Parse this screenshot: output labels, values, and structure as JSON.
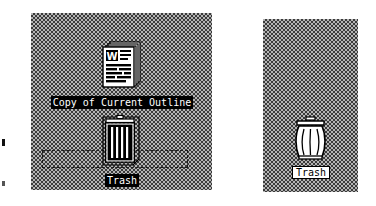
{
  "screen": {
    "width": 376,
    "height": 206,
    "background": "#ffffff",
    "desktop_pattern_color": "#b4b4b4",
    "desktop_dither_color": "#3a3a3a"
  },
  "panels": [
    {
      "id": "left",
      "name": "desktop-panel-drag-state",
      "description": "Finder desktop showing document being dragged onto Trash"
    },
    {
      "id": "right",
      "name": "desktop-panel-idle-state",
      "description": "Finder desktop showing empty Trash at rest"
    }
  ],
  "left_panel": {
    "document": {
      "icon": "word-document-icon",
      "glyph": "W",
      "label": "Copy of Current Outline",
      "selected": true
    },
    "trash": {
      "icon": "trash-can-icon",
      "label": "Trash",
      "selected": true,
      "state": "highlighted"
    },
    "drag_marquee": {
      "name": "drag-selection-marquee",
      "visible": true,
      "style": "dotted"
    }
  },
  "right_panel": {
    "trash": {
      "icon": "trash-can-icon",
      "label": "Trash",
      "selected": false,
      "state": "normal"
    }
  },
  "edge_marks": [
    {
      "name": "edge-tick-upper"
    },
    {
      "name": "edge-tick-lower"
    }
  ],
  "colors": {
    "selection_background": "#000000",
    "selection_text": "#ffffff",
    "label_background": "#ffffff",
    "label_text": "#000000",
    "icon_outline": "#000000",
    "icon_fill": "#ffffff"
  }
}
